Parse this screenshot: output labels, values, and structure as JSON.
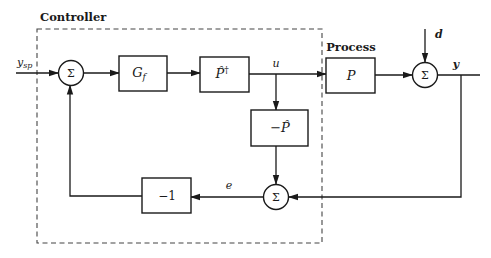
{
  "diagram": {
    "type": "block-diagram",
    "groups": [
      {
        "id": "controller",
        "label": "Controller",
        "style": "dashed"
      }
    ],
    "labels": {
      "controller": "Controller",
      "process": "Process",
      "input": "y",
      "input_sub": "sp",
      "disturbance": "d",
      "output": "y",
      "control": "u",
      "error": "e"
    },
    "blocks": [
      {
        "id": "sum1",
        "kind": "summing-junction",
        "label": "Σ"
      },
      {
        "id": "gf",
        "kind": "block",
        "label": "G",
        "sub": "f"
      },
      {
        "id": "pinv",
        "kind": "block",
        "label": "P̂",
        "sup": "†"
      },
      {
        "id": "negmodel",
        "kind": "block",
        "label": "−P̂"
      },
      {
        "id": "sum2",
        "kind": "summing-junction",
        "label": "Σ"
      },
      {
        "id": "neg1",
        "kind": "block",
        "label": "−1"
      },
      {
        "id": "plant",
        "kind": "block",
        "label": "P"
      },
      {
        "id": "sum3",
        "kind": "summing-junction",
        "label": "Σ"
      }
    ],
    "connections": [
      {
        "from": "y_sp",
        "to": "sum1"
      },
      {
        "from": "sum1",
        "to": "gf"
      },
      {
        "from": "gf",
        "to": "pinv"
      },
      {
        "from": "pinv",
        "to": "plant",
        "label": "u"
      },
      {
        "from": "u",
        "to": "negmodel"
      },
      {
        "from": "negmodel",
        "to": "sum2"
      },
      {
        "from": "plant",
        "to": "sum3"
      },
      {
        "from": "d",
        "to": "sum3"
      },
      {
        "from": "sum3",
        "to": "y",
        "label": "y"
      },
      {
        "from": "y",
        "to": "sum2"
      },
      {
        "from": "sum2",
        "to": "neg1",
        "label": "e"
      },
      {
        "from": "neg1",
        "to": "sum1"
      }
    ]
  }
}
